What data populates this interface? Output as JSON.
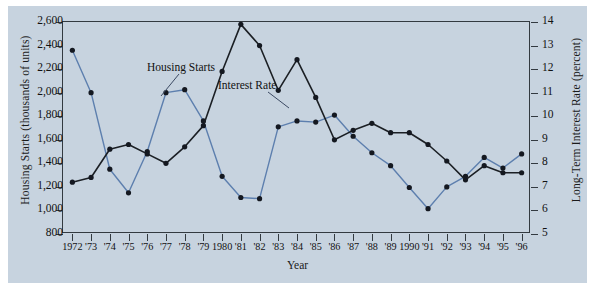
{
  "chart_data": {
    "type": "line",
    "title": "",
    "xlabel": "Year",
    "ylabel_left": "Housing Starts (thousands of units)",
    "ylabel_right": "Long-Term Interest Rate (percent)",
    "grid": false,
    "legend_position": "inline-annotations",
    "x": [
      1972,
      1973,
      1974,
      1975,
      1976,
      1977,
      1978,
      1979,
      1980,
      1981,
      1982,
      1983,
      1984,
      1985,
      1986,
      1987,
      1988,
      1989,
      1990,
      1991,
      1992,
      1993,
      1994,
      1995,
      1996
    ],
    "xtick_labels": [
      "1972",
      "'73",
      "'74",
      "'75",
      "'76",
      "'77",
      "'78",
      "'79",
      "1980",
      "'81",
      "'82",
      "'83",
      "'84",
      "'85",
      "'86",
      "'87",
      "'88",
      "'89",
      "1990",
      "'91",
      "'92",
      "'93",
      "'94",
      "'95",
      "'96"
    ],
    "ylim_left": [
      800,
      2600
    ],
    "ytick_labels_left": [
      "800",
      "1,000",
      "1,200",
      "1,400",
      "1,600",
      "1,800",
      "2,000",
      "2,200",
      "2,400",
      "2,600"
    ],
    "ytick_values_left": [
      800,
      1000,
      1200,
      1400,
      1600,
      1800,
      2000,
      2200,
      2400,
      2600
    ],
    "ylim_right": [
      5,
      14
    ],
    "ytick_labels_right": [
      "5",
      "6",
      "7",
      "8",
      "9",
      "10",
      "11",
      "12",
      "13",
      "14"
    ],
    "ytick_values_right": [
      5,
      6,
      7,
      8,
      9,
      10,
      11,
      12,
      13,
      14
    ],
    "series": [
      {
        "name": "Housing Starts",
        "axis": "left",
        "color": "#5d7fae",
        "marker": "circle",
        "units": "thousands of units",
        "values": [
          2360,
          2000,
          1350,
          1150,
          1500,
          2000,
          2025,
          1760,
          1290,
          1110,
          1100,
          1710,
          1760,
          1750,
          1810,
          1630,
          1490,
          1380,
          1195,
          1015,
          1200,
          1290,
          1450,
          1360,
          1480
        ]
      },
      {
        "name": "Interest Rate",
        "axis": "right",
        "color": "#1b1f24",
        "marker": "circle",
        "units": "percent",
        "values": [
          7.2,
          7.4,
          8.6,
          8.8,
          8.4,
          8.0,
          8.7,
          9.6,
          11.9,
          13.9,
          13.0,
          11.1,
          12.4,
          10.8,
          9.0,
          9.4,
          9.7,
          9.3,
          9.3,
          8.8,
          8.1,
          7.3,
          7.9,
          7.6,
          7.6
        ]
      }
    ],
    "annotations": [
      {
        "text": "Housing Starts",
        "series": "Housing Starts"
      },
      {
        "text": "Interest Rate",
        "series": "Interest Rate"
      }
    ]
  },
  "figure": {
    "background_color": "#c7d3df",
    "frame_color": "#333a40",
    "axis_title_x": "Year",
    "axis_title_y_left": "Housing Starts (thousands of units)",
    "axis_title_y_right": "Long-Term Interest Rate (percent)",
    "annotation_housing": "Housing Starts",
    "annotation_interest": "Interest Rate"
  }
}
